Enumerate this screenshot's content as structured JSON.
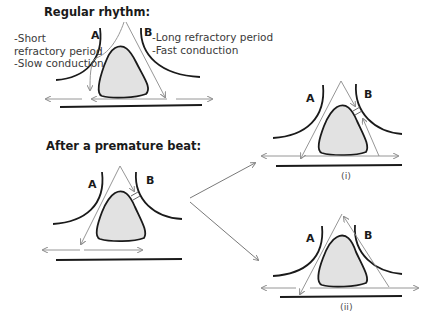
{
  "sections": {
    "regular": {
      "heading": "Regular rhythm:",
      "pathway_a_label": "A",
      "pathway_b_label": "B",
      "pathway_a_notes": "-Short\nrefractory period\n-Slow conduction",
      "pathway_b_notes": "-Long refractory period\n-Fast conduction"
    },
    "premature": {
      "heading": "After a premature beat:",
      "pathway_a_label": "A",
      "pathway_b_label": "B"
    },
    "outcome_i": {
      "pathway_a_label": "A",
      "pathway_b_label": "B",
      "caption": "(i)"
    },
    "outcome_ii": {
      "pathway_a_label": "A",
      "pathway_b_label": "B",
      "caption": "(ii)"
    }
  },
  "colors": {
    "tissue_outline": "#1a1a1a",
    "core_fill": "#e2e2e2",
    "arrow": "#8a8a8a",
    "text": "#1a1a1a"
  }
}
